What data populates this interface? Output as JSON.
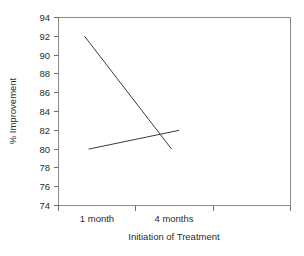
{
  "chart_data": {
    "type": "line",
    "title": "",
    "subtitle": "",
    "xlabel": "Initiation of Treatment",
    "ylabel": "% Improvement",
    "categories": [
      "1 month",
      "4 months"
    ],
    "ylim": [
      74,
      94
    ],
    "yticks": [
      74,
      76,
      78,
      80,
      82,
      84,
      86,
      88,
      90,
      92,
      94
    ],
    "ytick_labels": [
      "74",
      "76",
      "78",
      "80",
      "82",
      "84",
      "86",
      "88",
      "90",
      "92",
      "94"
    ],
    "xlim": [
      0,
      4
    ],
    "xticks": [
      0,
      1,
      2,
      3
    ],
    "xtick_labels": [
      "",
      "",
      "",
      ""
    ],
    "grid": false,
    "legend": false,
    "legend_position": "none",
    "series": [
      {
        "name": "declining-series",
        "x": [
          0.45,
          1.95
        ],
        "values": [
          92,
          80
        ]
      },
      {
        "name": "rising-series",
        "x": [
          0.52,
          2.08
        ],
        "values": [
          80,
          82
        ]
      }
    ],
    "annotations": [],
    "colors": {
      "line": "#3a3a3a",
      "frame": "#8a8a8a",
      "text": "#2b2b2b",
      "background": "#ffffff"
    }
  },
  "axes": {
    "y_title": "% Improvement",
    "x_title": "Initiation of Treatment",
    "y_tick_labels": [
      "94",
      "92",
      "90",
      "88",
      "86",
      "84",
      "82",
      "80",
      "78",
      "76",
      "74"
    ],
    "x_category_labels": [
      "1 month",
      "4 months"
    ]
  }
}
